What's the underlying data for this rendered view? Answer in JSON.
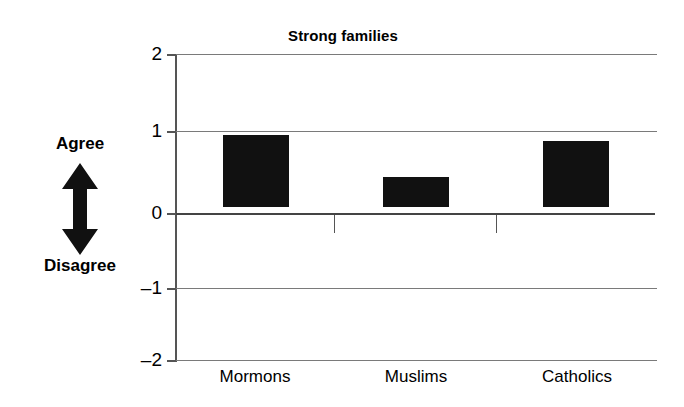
{
  "chart_data": {
    "type": "bar",
    "title": "Strong families",
    "xlabel": "",
    "ylabel": "",
    "categories": [
      "Mormons",
      "Muslims",
      "Catholics"
    ],
    "values": [
      0.95,
      0.4,
      0.87
    ],
    "ylim": [
      -2,
      2
    ],
    "yticks": [
      2,
      1,
      0,
      -1,
      -2
    ],
    "ytick_labels": [
      "2",
      "1",
      "0",
      "–1",
      "–2"
    ],
    "grid": true,
    "legend": null,
    "bar_color": "#111111",
    "annotations": {
      "axis_direction_top": "Agree",
      "axis_direction_bottom": "Disagree",
      "arrow": "double-headed-vertical-arrow"
    }
  },
  "y_tick_labels": {
    "t0": "2",
    "t1": "1",
    "t2": "0",
    "t3": "–1",
    "t4": "–2"
  },
  "x_labels": {
    "c0": "Mormons",
    "c1": "Muslims",
    "c2": "Catholics"
  },
  "colors": {
    "bar": "#111111",
    "grid": "#7a7a7a",
    "axis": "#555555",
    "background": "#ffffff",
    "text": "#000000"
  }
}
